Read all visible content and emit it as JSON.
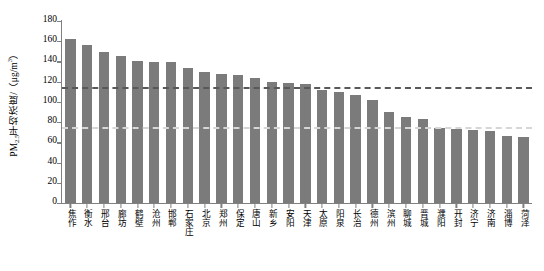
{
  "chart_data": {
    "type": "bar",
    "title": "",
    "xlabel": "",
    "ylabel": "PM2.5平均浓度/（μg/m³）",
    "ylabel_parts": {
      "prefix": "PM",
      "subscript": "2.5",
      "middle": "平均浓度/（μg/m",
      "superscript": "3",
      "suffix": "）"
    },
    "ylim": [
      0,
      180
    ],
    "yticks": [
      0,
      20,
      40,
      60,
      80,
      100,
      120,
      140,
      160,
      180
    ],
    "ytick_labels": [
      "0",
      "20",
      "40",
      "60",
      "80",
      "100",
      "120",
      "140",
      "160",
      "180"
    ],
    "grid": false,
    "legend": "none",
    "bar_color": "#7b7b7b",
    "categories": [
      "焦作",
      "衡水",
      "邢台",
      "廊坊",
      "鹤壁",
      "沧州",
      "邯郸",
      "石家庄",
      "北京",
      "郑州",
      "保定",
      "唐山",
      "新乡",
      "安阳",
      "天津",
      "太原",
      "阳泉",
      "长治",
      "德州",
      "滨州",
      "聊城",
      "晋城",
      "濮阳",
      "开封",
      "济宁",
      "济南",
      "淄博",
      "菏泽"
    ],
    "values": [
      162,
      156,
      149,
      145,
      140,
      139,
      139,
      134,
      130,
      128,
      127,
      124,
      120,
      119,
      118,
      112,
      110,
      107,
      102,
      90,
      85,
      83,
      74,
      73,
      72,
      71,
      66,
      65
    ],
    "reference_lines": [
      {
        "name": "regional-average",
        "value": 115,
        "color": "#585858",
        "style": "dashed"
      },
      {
        "name": "grade-ii-standard",
        "value": 75,
        "color": "#d6d6d6",
        "style": "dashed"
      }
    ]
  }
}
